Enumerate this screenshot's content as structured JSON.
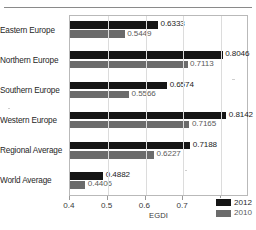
{
  "figure": {
    "has_top_rule": true,
    "background": "#ffffff"
  },
  "chart_data": {
    "type": "bar",
    "orientation": "horizontal",
    "title": "",
    "xlabel": "EGDI",
    "ylabel": "",
    "xlim": [
      0.4,
      0.8742
    ],
    "xticks": [
      0.4,
      0.5,
      0.6,
      0.7,
      0.8
    ],
    "xtick_labels": [
      "0.4",
      "0.5",
      "0.6",
      "0.7",
      "0.8"
    ],
    "grid": "vertical-only",
    "legend_position": "lower-right-inside",
    "categories": [
      "Eastern Europe",
      "Northern Europe",
      "Southern Europe",
      "Western Europe",
      "Regional Average",
      "World Average"
    ],
    "series": [
      {
        "name": "2012",
        "color": "#151515",
        "values": [
          0.6333,
          0.8046,
          0.6574,
          0.8142,
          0.7188,
          0.4882
        ],
        "labels": [
          "0.6333",
          "0.8046",
          "0.6574",
          "0.8142",
          "0.7188",
          "0.4882"
        ]
      },
      {
        "name": "2010",
        "color": "#6b6b6b",
        "values": [
          0.5449,
          0.7113,
          0.5566,
          0.7165,
          0.6227,
          0.4406
        ],
        "labels": [
          "0.5449",
          "0.7113",
          "0.5566",
          "0.7165",
          "0.6227",
          "0.4406"
        ]
      }
    ]
  },
  "legend": {
    "entries": [
      {
        "label": "2012",
        "color": "#151515"
      },
      {
        "label": "2010",
        "color": "#6b6b6b"
      }
    ]
  }
}
